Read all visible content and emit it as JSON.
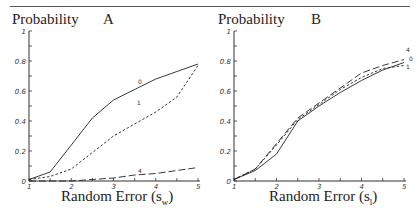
{
  "chart_data": [
    {
      "type": "line",
      "panel": "A",
      "title": "A",
      "ylabel": "Probability",
      "xlabel": "Random Error (s_w)",
      "xlabel_main": "Random Error (s",
      "xlabel_sub": "w",
      "xlim": [
        1,
        5
      ],
      "ylim": [
        0,
        1
      ],
      "xticks": [
        "1",
        "2",
        "3",
        "4",
        "5"
      ],
      "yticks": [
        "0",
        "0.2",
        "0.4",
        "0.6",
        "0.8",
        "1"
      ],
      "grid": false,
      "x": [
        1,
        1.5,
        2,
        2.5,
        3,
        3.5,
        4,
        4.5,
        5
      ],
      "series": [
        {
          "name": "0",
          "style": "solid",
          "values": [
            0.01,
            0.06,
            0.24,
            0.42,
            0.54,
            0.61,
            0.68,
            0.73,
            0.78
          ]
        },
        {
          "name": "1",
          "style": "dashed",
          "values": [
            0.01,
            0.03,
            0.08,
            0.19,
            0.3,
            0.38,
            0.46,
            0.56,
            0.77
          ]
        },
        {
          "name": "4",
          "style": "long-dash",
          "values": [
            0.0,
            0.0,
            0.0,
            0.01,
            0.02,
            0.04,
            0.05,
            0.07,
            0.09
          ]
        }
      ],
      "annotations": [
        "0",
        "1",
        "4"
      ]
    },
    {
      "type": "line",
      "panel": "B",
      "title": "B",
      "ylabel": "Probability",
      "xlabel": "Random Error (s_l)",
      "xlabel_main": "Random Error (s",
      "xlabel_sub": "l",
      "xlim": [
        1,
        5
      ],
      "ylim": [
        0,
        1
      ],
      "xticks": [
        "1",
        "2",
        "3",
        "4",
        "5"
      ],
      "yticks": [
        "0",
        "0.2",
        "0.4",
        "0.6",
        "0.8",
        "1"
      ],
      "grid": false,
      "x": [
        1,
        1.5,
        2,
        2.5,
        3,
        3.5,
        4,
        4.5,
        5
      ],
      "series": [
        {
          "name": "0",
          "style": "solid",
          "values": [
            0.01,
            0.07,
            0.18,
            0.4,
            0.5,
            0.59,
            0.67,
            0.74,
            0.79
          ]
        },
        {
          "name": "1",
          "style": "dashed",
          "values": [
            0.01,
            0.08,
            0.24,
            0.41,
            0.51,
            0.61,
            0.69,
            0.75,
            0.77
          ]
        },
        {
          "name": "4",
          "style": "long-dash",
          "values": [
            0.01,
            0.08,
            0.25,
            0.42,
            0.52,
            0.62,
            0.72,
            0.77,
            0.81
          ]
        }
      ],
      "annotations": [
        "4",
        "0",
        "1"
      ]
    }
  ],
  "panels": {
    "a": {
      "ylabel": "Probability",
      "letter": "A",
      "xlabel_main": "Random Error (s",
      "xlabel_sub": "w",
      "xlabel_close": ")"
    },
    "b": {
      "ylabel": "Probability",
      "letter": "B",
      "xlabel_main": "Random Error (s",
      "xlabel_sub": "l",
      "xlabel_close": ")"
    }
  }
}
